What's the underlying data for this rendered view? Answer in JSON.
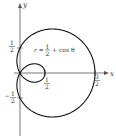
{
  "figure": {
    "equation": {
      "lhs": "r =",
      "frac_num": "1",
      "frac_den": "2",
      "rhs": "+ cos θ"
    },
    "axes": {
      "x_label": "x",
      "y_label": "y"
    },
    "ticks": {
      "x_half": {
        "num": "1",
        "den": "2"
      },
      "x_three_half": {
        "num": "3",
        "den": "2"
      },
      "y_half": {
        "num": "1",
        "den": "2"
      },
      "y_neg_half": {
        "sign": "−",
        "num": "1",
        "den": "2"
      }
    },
    "curve_color": "#111111",
    "axis_color": "#555555"
  }
}
